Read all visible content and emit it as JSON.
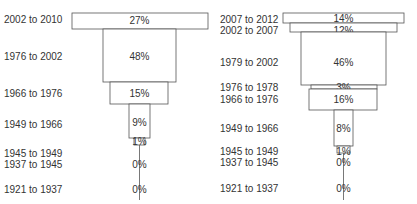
{
  "chart_data": [
    {
      "type": "bar",
      "subtype": "stacked-funnel",
      "title": "",
      "xlabel": "",
      "ylabel": "",
      "categories": [
        "2002 to 2010",
        "1976 to 2002",
        "1966 to 1976",
        "1949 to 1966",
        "1945 to 1949",
        "1937 to 1945",
        "1921 to 1937"
      ],
      "values": [
        27,
        48,
        15,
        9,
        1,
        0,
        0
      ],
      "labels": [
        "27%",
        "48%",
        "15%",
        "9%",
        "1%",
        "0%",
        "0%"
      ],
      "unit": "%"
    },
    {
      "type": "bar",
      "subtype": "stacked-funnel",
      "title": "",
      "xlabel": "",
      "ylabel": "",
      "categories": [
        "2007 to 2012",
        "2002 to 2007",
        "1979 to 2002",
        "1976 to 1978",
        "1966 to 1976",
        "1949 to 1966",
        "1945 to 1949",
        "1937 to 1945",
        "1921 to 1937"
      ],
      "values": [
        14,
        12,
        46,
        3,
        16,
        8,
        1,
        0,
        0
      ],
      "labels": [
        "14%",
        "12%",
        "46%",
        "3%",
        "16%",
        "8%",
        "1%",
        "0%",
        "0%"
      ],
      "unit": "%"
    }
  ]
}
